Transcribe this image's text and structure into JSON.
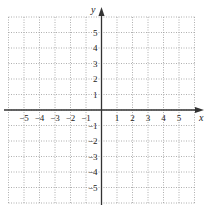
{
  "chart_data": {
    "type": "scatter",
    "title": "",
    "xlabel": "x",
    "ylabel": "y",
    "xlim": [
      -6,
      6
    ],
    "ylim": [
      -6,
      6
    ],
    "grid": true,
    "grid_style": "dotted",
    "x_ticks": [
      -5,
      -4,
      -3,
      -2,
      -1,
      1,
      2,
      3,
      4,
      5
    ],
    "y_ticks": [
      5,
      4,
      3,
      2,
      1,
      -1,
      -2,
      -3,
      -4,
      -5
    ],
    "x_tick_labels": [
      "−5",
      "−4",
      "−3",
      "−2",
      "−1",
      "1",
      "2",
      "3",
      "4",
      "5"
    ],
    "y_tick_labels": [
      "5",
      "4",
      "3",
      "2",
      "1",
      "−1",
      "−2",
      "−3",
      "−4",
      "−5"
    ],
    "series": [],
    "colors": {
      "axis": "#333333",
      "grid": "#9a9a9a",
      "text": "#222222"
    }
  }
}
